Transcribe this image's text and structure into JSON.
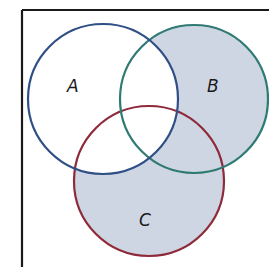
{
  "diagram": {
    "type": "venn",
    "universe_frame": {
      "color": "#1a1a1a",
      "left_x": 22,
      "top_y": 10
    },
    "shaded_region": "(B ∪ C) − A",
    "shade_color": "#cfd6e3",
    "sets": [
      {
        "id": "A",
        "label": "A",
        "cx": 103,
        "cy": 99,
        "r": 75,
        "stroke": "#2f4f86",
        "label_x": 73,
        "label_y": 86
      },
      {
        "id": "B",
        "label": "B",
        "cx": 194,
        "cy": 99,
        "r": 74,
        "stroke": "#2f7a72",
        "label_x": 213,
        "label_y": 86
      },
      {
        "id": "C",
        "label": "C",
        "cx": 149,
        "cy": 181,
        "r": 75,
        "stroke": "#8e2a3a",
        "label_x": 145,
        "label_y": 220
      }
    ]
  }
}
